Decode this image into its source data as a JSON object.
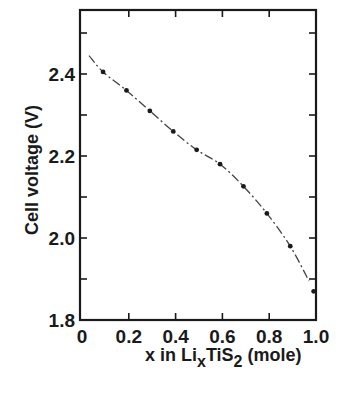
{
  "chart_data": {
    "type": "line",
    "title": "",
    "xlabel": "x in LixTiS2 (mole)",
    "xlabel_parts": {
      "pre": "x in Li",
      "sub1": "x",
      "mid": "TiS",
      "sub2": "2",
      "post": " (mole)"
    },
    "ylabel": "Cell voltage (V)",
    "xlim": [
      0,
      1.0
    ],
    "ylim": [
      1.8,
      2.55
    ],
    "x_ticks": [
      0,
      0.2,
      0.4,
      0.6,
      0.8,
      1.0
    ],
    "x_tick_labels": [
      "0",
      "0.2",
      "0.4",
      "0.6",
      "0.8",
      "1.0"
    ],
    "y_ticks": [
      1.8,
      2.0,
      2.2,
      2.4
    ],
    "y_tick_labels": [
      "1.8",
      "2.0",
      "2.2",
      "2.4"
    ],
    "y_minor_ticks": [
      1.9,
      2.1,
      2.3,
      2.5
    ],
    "grid": false,
    "legend": null,
    "series": [
      {
        "name": "Cell voltage",
        "style": "dash-dot with point markers",
        "curve": {
          "x": [
            0.03,
            0.09,
            0.19,
            0.29,
            0.39,
            0.49,
            0.59,
            0.69,
            0.79,
            0.89,
            0.97
          ],
          "y": [
            2.445,
            2.405,
            2.36,
            2.31,
            2.26,
            2.215,
            2.18,
            2.126,
            2.06,
            1.98,
            1.895
          ]
        },
        "points": {
          "x": [
            0.09,
            0.19,
            0.29,
            0.39,
            0.49,
            0.59,
            0.69,
            0.79,
            0.89,
            0.99
          ],
          "y": [
            2.405,
            2.36,
            2.31,
            2.26,
            2.215,
            2.18,
            2.126,
            2.06,
            1.98,
            1.87
          ]
        }
      }
    ],
    "colors": {
      "ink": "#1a1a1a",
      "background": "#ffffff"
    }
  }
}
